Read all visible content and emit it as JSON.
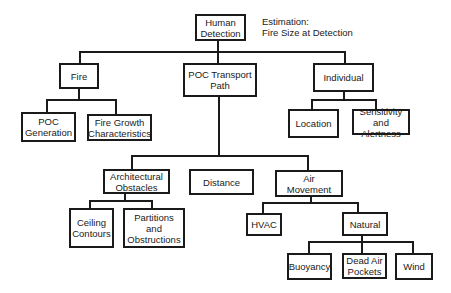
{
  "diagram": {
    "type": "hierarchy-tree",
    "annotation": "Estimation:\nFire Size at Detection",
    "root": {
      "label": "Human\nDetection"
    },
    "nodes": {
      "fire": "Fire",
      "poc_transport_path": "POC Transport\nPath",
      "individual": "Individual",
      "poc_generation": "POC\nGeneration",
      "fire_growth": "Fire Growth\nCharacteristics",
      "location": "Location",
      "sensitivity": "Sensitivity\nand Alertness",
      "architectural_obstacles": "Architectural\nObstacles",
      "distance": "Distance",
      "air_movement": "Air\nMovement",
      "ceiling_contours": "Ceiling\nContours",
      "partitions": "Partitions\nand\nObstructions",
      "hvac": "HVAC",
      "natural": "Natural",
      "buoyancy": "Buoyancy",
      "dead_air_pockets": "Dead Air\nPockets",
      "wind": "Wind"
    },
    "edges": [
      [
        "Human Detection",
        "Fire"
      ],
      [
        "Human Detection",
        "POC Transport Path"
      ],
      [
        "Human Detection",
        "Individual"
      ],
      [
        "Fire",
        "POC Generation"
      ],
      [
        "Fire",
        "Fire Growth Characteristics"
      ],
      [
        "Individual",
        "Location"
      ],
      [
        "Individual",
        "Sensitivity and Alertness"
      ],
      [
        "POC Transport Path",
        "Architectural Obstacles"
      ],
      [
        "POC Transport Path",
        "Distance"
      ],
      [
        "POC Transport Path",
        "Air Movement"
      ],
      [
        "Architectural Obstacles",
        "Ceiling Contours"
      ],
      [
        "Architectural Obstacles",
        "Partitions and Obstructions"
      ],
      [
        "Air Movement",
        "HVAC"
      ],
      [
        "Air Movement",
        "Natural"
      ],
      [
        "Natural",
        "Buoyancy"
      ],
      [
        "Natural",
        "Dead Air Pockets"
      ],
      [
        "Natural",
        "Wind"
      ]
    ]
  }
}
